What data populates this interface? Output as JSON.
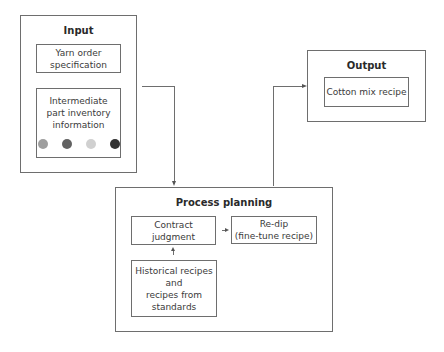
{
  "input": {
    "title": "Input",
    "yarn_order": [
      "Yarn order",
      "specification"
    ],
    "inventory": [
      "Intermediate",
      "part inventory",
      "information"
    ],
    "dot_colors": [
      "#9e9e9e",
      "#626262",
      "#d0d0d0",
      "#333333"
    ]
  },
  "output": {
    "title": "Output",
    "cotton_mix": "Cotton mix recipe"
  },
  "process": {
    "title": "Process planning",
    "contract": [
      "Contract",
      "judgment"
    ],
    "redip": [
      "Re-dip",
      "(fine-tune recipe)"
    ],
    "historical": [
      "Historical recipes",
      "and",
      "recipes from",
      "standards"
    ]
  }
}
